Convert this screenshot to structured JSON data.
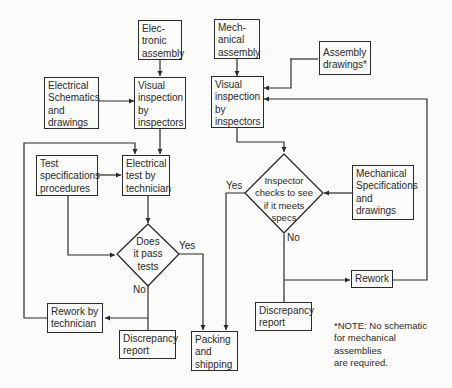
{
  "diagram": {
    "type": "flowchart",
    "nodes": {
      "electronic_assembly": [
        "Elec-",
        "tronic",
        "assembly"
      ],
      "mechanical_assembly": [
        "Mech-",
        "anical",
        "assembly"
      ],
      "assembly_drawings": [
        "Assembly",
        "drawings*"
      ],
      "electrical_schematics": [
        "Electrical",
        "Schematics",
        "and",
        "drawings"
      ],
      "visual_inspection_electronic": [
        "Visual",
        "inspection",
        "by",
        "inspectors"
      ],
      "visual_inspection_mechanical": [
        "Visual",
        "inspection",
        "by",
        "inspectors"
      ],
      "test_specifications": [
        "Test",
        "specifications",
        "procedures"
      ],
      "electrical_test": [
        "Electrical",
        "test by",
        "technician"
      ],
      "does_it_pass": [
        "Does",
        "it  pass",
        "tests"
      ],
      "inspector_checks": [
        "Inspector",
        "checks to see",
        "if it meets",
        "specs"
      ],
      "mechanical_specifications": [
        "Mechanical",
        "Specifications",
        "and",
        "drawings"
      ],
      "rework": [
        "Rework"
      ],
      "rework_by_technician": [
        "Rework by",
        "technician"
      ],
      "discrepancy_report_electronic": [
        "Discrepancy",
        "report"
      ],
      "discrepancy_report_mechanical": [
        "Discrepancy",
        "report"
      ],
      "packing_and_shipping": [
        "Packing",
        "and",
        "shipping"
      ]
    },
    "edge_labels": {
      "yes_electronic": "Yes",
      "no_electronic": "No",
      "yes_mechanical": "Yes",
      "no_mechanical": "No"
    },
    "note": [
      "*NOTE: No schematic",
      "for mechanical",
      "assemblies",
      "are required."
    ]
  }
}
